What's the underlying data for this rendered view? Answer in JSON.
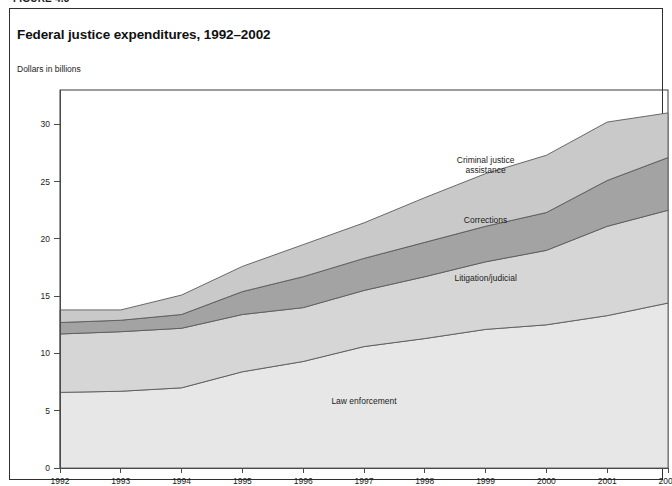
{
  "figure": {
    "caption_partial": "FIGURE 4.3",
    "title": "Federal justice expenditures, 1992–2002",
    "unit_label": "Dollars in billions"
  },
  "chart_data": {
    "type": "area",
    "stacked": true,
    "title": "Federal justice expenditures, 1992–2002",
    "subtitle": "",
    "xlabel": "",
    "ylabel": "Dollars in billions",
    "x": [
      1992,
      1993,
      1994,
      1995,
      1996,
      1997,
      1998,
      1999,
      2000,
      2001,
      2002
    ],
    "xtick_labels": [
      "1992",
      "1993",
      "1994",
      "1995",
      "1996",
      "1997",
      "1998",
      "1999",
      "2000",
      "2001",
      "2002"
    ],
    "ytick_labels": [
      "0",
      "5",
      "10",
      "15",
      "20",
      "25",
      "30"
    ],
    "yticks": [
      0,
      5,
      10,
      15,
      20,
      25,
      30
    ],
    "ylim": [
      0,
      33
    ],
    "xlim": [
      1992,
      2002
    ],
    "grid": false,
    "legend_position": "inline-annotations",
    "series": [
      {
        "name": "Law enforcement",
        "color": "#e7e7e7",
        "values": [
          6.6,
          6.7,
          7.0,
          8.4,
          9.3,
          10.6,
          11.3,
          12.1,
          12.5,
          13.3,
          14.4
        ],
        "label_x": 1997.0,
        "label_y": 5.6
      },
      {
        "name": "Litigation/judicial",
        "color": "#d6d6d6",
        "values": [
          5.1,
          5.2,
          5.2,
          5.0,
          4.7,
          4.9,
          5.4,
          5.9,
          6.5,
          7.8,
          8.1
        ],
        "cumulative_top": [
          11.7,
          11.9,
          12.2,
          13.4,
          14.0,
          15.5,
          16.7,
          18.0,
          19.0,
          21.1,
          22.5
        ],
        "label_x": 1999.0,
        "label_y": 16.3
      },
      {
        "name": "Corrections",
        "color": "#a3a3a3",
        "values": [
          1.0,
          1.0,
          1.2,
          2.0,
          2.7,
          2.8,
          3.0,
          3.1,
          3.3,
          4.0,
          4.6
        ],
        "cumulative_top": [
          12.7,
          12.9,
          13.4,
          15.4,
          16.7,
          18.3,
          19.7,
          21.1,
          22.3,
          25.1,
          27.1
        ],
        "label_x": 1999.0,
        "label_y": 21.4
      },
      {
        "name": "Criminal justice assistance",
        "color": "#c9c9c9",
        "values": [
          1.1,
          0.9,
          1.7,
          2.2,
          2.8,
          3.1,
          3.9,
          4.6,
          5.0,
          5.1,
          3.9
        ],
        "cumulative_top": [
          13.8,
          13.8,
          15.1,
          17.6,
          19.5,
          21.4,
          23.6,
          25.7,
          27.3,
          30.2,
          31.0
        ],
        "label_x": 1999.0,
        "label_y": 26.6,
        "label_line1": "Criminal justice",
        "label_line2": "assistance"
      }
    ]
  }
}
